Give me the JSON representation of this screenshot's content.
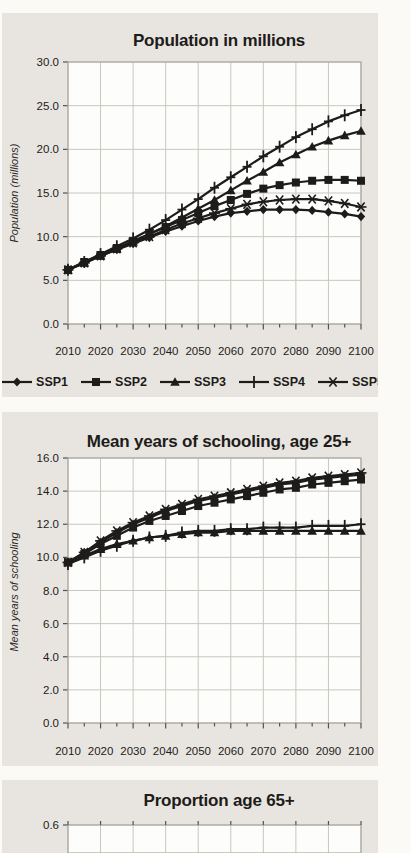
{
  "colors": {
    "ink": "#1d1c1a",
    "panel_bg": "#e8e5e0",
    "plot_bg": "#fdfdfb",
    "grid": "#c9c6c0",
    "plot_border": "#aaa8a2",
    "tick": "#55534f",
    "page_bg": "#fbfaf7"
  },
  "legend": {
    "items": [
      {
        "label": "SSP1",
        "marker": "diamond"
      },
      {
        "label": "SSP2",
        "marker": "square"
      },
      {
        "label": "SSP3",
        "marker": "triangle"
      },
      {
        "label": "SSP4",
        "marker": "plus"
      },
      {
        "label": "SSP5",
        "marker": "asterisk"
      }
    ]
  },
  "chart_data": [
    {
      "id": "population",
      "type": "line",
      "title": "Population in millions",
      "xlabel": "",
      "ylabel": "Population (millions)",
      "ylim": [
        0,
        30
      ],
      "grid": true,
      "legend_position": "bottom",
      "x": [
        2010,
        2015,
        2020,
        2025,
        2030,
        2035,
        2040,
        2045,
        2050,
        2055,
        2060,
        2065,
        2070,
        2075,
        2080,
        2085,
        2090,
        2095,
        2100
      ],
      "xtick_labels": [
        "2010",
        "2020",
        "2030",
        "2040",
        "2050",
        "2060",
        "2070",
        "2080",
        "2090",
        "2100"
      ],
      "ytick_labels": [
        "30.0",
        "25.0",
        "20.0",
        "15.0",
        "10.0",
        "5.0",
        "0.0"
      ],
      "yticks": [
        30,
        25,
        20,
        15,
        10,
        5,
        0
      ],
      "series": [
        {
          "name": "SSP4",
          "marker": "plus",
          "values": [
            6.2,
            7.1,
            8.0,
            8.9,
            9.8,
            10.8,
            11.9,
            13.1,
            14.3,
            15.6,
            16.8,
            18.0,
            19.2,
            20.3,
            21.4,
            22.3,
            23.2,
            23.9,
            24.5
          ]
        },
        {
          "name": "SSP3",
          "marker": "triangle",
          "values": [
            6.2,
            7.0,
            7.8,
            8.6,
            9.4,
            10.3,
            11.2,
            12.2,
            13.2,
            14.2,
            15.3,
            16.4,
            17.4,
            18.5,
            19.4,
            20.3,
            21.0,
            21.6,
            22.1
          ]
        },
        {
          "name": "SSP5",
          "marker": "asterisk",
          "values": [
            6.2,
            7.0,
            7.8,
            8.6,
            9.3,
            10.0,
            10.8,
            11.5,
            12.1,
            12.7,
            13.2,
            13.7,
            14.0,
            14.2,
            14.3,
            14.3,
            14.1,
            13.8,
            13.4
          ]
        },
        {
          "name": "SSP1",
          "marker": "diamond",
          "values": [
            6.2,
            7.0,
            7.8,
            8.5,
            9.2,
            9.9,
            10.6,
            11.2,
            11.8,
            12.3,
            12.7,
            12.9,
            13.1,
            13.1,
            13.1,
            13.0,
            12.8,
            12.6,
            12.3
          ]
        },
        {
          "name": "SSP2",
          "marker": "square",
          "values": [
            6.2,
            7.1,
            7.9,
            8.7,
            9.5,
            10.3,
            11.1,
            11.9,
            12.7,
            13.5,
            14.2,
            14.9,
            15.5,
            15.9,
            16.2,
            16.4,
            16.5,
            16.5,
            16.4
          ]
        }
      ]
    },
    {
      "id": "schooling",
      "type": "line",
      "title": "Mean years of schooling, age 25+",
      "xlabel": "",
      "ylabel": "Mean years of schooling",
      "ylim": [
        0,
        16
      ],
      "grid": true,
      "legend_position": "none",
      "x": [
        2010,
        2015,
        2020,
        2025,
        2030,
        2035,
        2040,
        2045,
        2050,
        2055,
        2060,
        2065,
        2070,
        2075,
        2080,
        2085,
        2090,
        2095,
        2100
      ],
      "xtick_labels": [
        "2010",
        "2020",
        "2030",
        "2040",
        "2050",
        "2060",
        "2070",
        "2080",
        "2090",
        "2100"
      ],
      "ytick_labels": [
        "16.0",
        "14.0",
        "12.0",
        "10.0",
        "8.0",
        "6.0",
        "4.0",
        "2.0",
        "0.0"
      ],
      "yticks": [
        16,
        14,
        12,
        10,
        8,
        6,
        4,
        2,
        0
      ],
      "series": [
        {
          "name": "SSP4",
          "marker": "plus",
          "values": [
            9.6,
            10.0,
            10.4,
            10.7,
            11.0,
            11.2,
            11.3,
            11.5,
            11.6,
            11.6,
            11.7,
            11.7,
            11.8,
            11.8,
            11.8,
            11.9,
            11.9,
            11.9,
            12.0
          ]
        },
        {
          "name": "SSP3",
          "marker": "triangle",
          "values": [
            9.7,
            10.1,
            10.5,
            10.8,
            11.0,
            11.2,
            11.3,
            11.4,
            11.5,
            11.5,
            11.6,
            11.6,
            11.6,
            11.6,
            11.6,
            11.6,
            11.6,
            11.6,
            11.6
          ]
        },
        {
          "name": "SSP5",
          "marker": "asterisk",
          "values": [
            9.7,
            10.3,
            11.0,
            11.6,
            12.1,
            12.5,
            12.9,
            13.2,
            13.5,
            13.7,
            13.9,
            14.1,
            14.3,
            14.5,
            14.6,
            14.8,
            14.9,
            15.0,
            15.1
          ]
        },
        {
          "name": "SSP1",
          "marker": "diamond",
          "values": [
            9.7,
            10.3,
            10.9,
            11.5,
            12.0,
            12.4,
            12.8,
            13.1,
            13.4,
            13.6,
            13.8,
            14.0,
            14.2,
            14.4,
            14.5,
            14.7,
            14.8,
            14.9,
            15.0
          ]
        },
        {
          "name": "SSP2",
          "marker": "square",
          "values": [
            9.7,
            10.2,
            10.8,
            11.3,
            11.8,
            12.2,
            12.5,
            12.8,
            13.1,
            13.3,
            13.5,
            13.7,
            13.9,
            14.1,
            14.2,
            14.4,
            14.5,
            14.6,
            14.7
          ]
        }
      ]
    },
    {
      "id": "age65",
      "type": "line",
      "title": "Proportion age 65+",
      "xlabel": "",
      "ylabel": "",
      "cropped": true,
      "ytick_labels": [
        "0.6"
      ],
      "yticks": [
        0.6
      ],
      "xtick_labels": [],
      "series": []
    }
  ],
  "right_edge": {
    "fragments": [
      {
        "y": 1,
        "kind": "tick"
      },
      {
        "y": 14,
        "kind": "block",
        "h": 24
      },
      {
        "y": 71,
        "kind": "header",
        "glyph": "P"
      },
      {
        "y": 87,
        "kind": "thickrule"
      },
      {
        "y": 94,
        "kind": "row",
        "glyph": "S"
      },
      {
        "y": 119,
        "kind": "row",
        "glyph": "S"
      },
      {
        "y": 144,
        "kind": "row",
        "glyph": "S"
      },
      {
        "y": 169,
        "kind": "row",
        "glyph": "S"
      },
      {
        "y": 194,
        "kind": "row",
        "glyph": "S"
      },
      {
        "y": 222,
        "kind": "header",
        "glyph": "P"
      },
      {
        "y": 237,
        "kind": "thickrule"
      },
      {
        "y": 245,
        "kind": "row",
        "glyph": "S"
      },
      {
        "y": 270,
        "kind": "row",
        "glyph": "S"
      },
      {
        "y": 295,
        "kind": "row",
        "glyph": "S"
      },
      {
        "y": 318,
        "kind": "row",
        "glyph": "S"
      },
      {
        "y": 341,
        "kind": "row",
        "glyph": "S"
      },
      {
        "y": 367,
        "kind": "header",
        "glyph": "P"
      },
      {
        "y": 381,
        "kind": "thickrule"
      },
      {
        "y": 386,
        "kind": "row",
        "glyph": "S"
      },
      {
        "y": 409,
        "kind": "row",
        "glyph": "S"
      },
      {
        "y": 433,
        "kind": "row",
        "glyph": "S"
      },
      {
        "y": 458,
        "kind": "row",
        "glyph": "S"
      },
      {
        "y": 483,
        "kind": "row",
        "glyph": "S"
      },
      {
        "y": 508,
        "kind": "row",
        "glyph": "S"
      },
      {
        "y": 532,
        "kind": "header",
        "glyph": "P"
      },
      {
        "y": 546,
        "kind": "thickrule"
      },
      {
        "y": 558,
        "kind": "row",
        "glyph": "S"
      },
      {
        "y": 583,
        "kind": "row",
        "glyph": "S"
      },
      {
        "y": 608,
        "kind": "row",
        "glyph": "S"
      },
      {
        "y": 638,
        "kind": "row",
        "glyph": "S"
      },
      {
        "y": 663,
        "kind": "row",
        "glyph": "S"
      },
      {
        "y": 694,
        "kind": "header",
        "glyph": "P"
      },
      {
        "y": 708,
        "kind": "thickrule"
      },
      {
        "y": 723,
        "kind": "row",
        "glyph": "S"
      },
      {
        "y": 748,
        "kind": "row",
        "glyph": "S"
      },
      {
        "y": 773,
        "kind": "row",
        "glyph": "S"
      },
      {
        "y": 823,
        "kind": "thickdash"
      },
      {
        "y": 841,
        "kind": "block",
        "h": 12
      }
    ]
  }
}
